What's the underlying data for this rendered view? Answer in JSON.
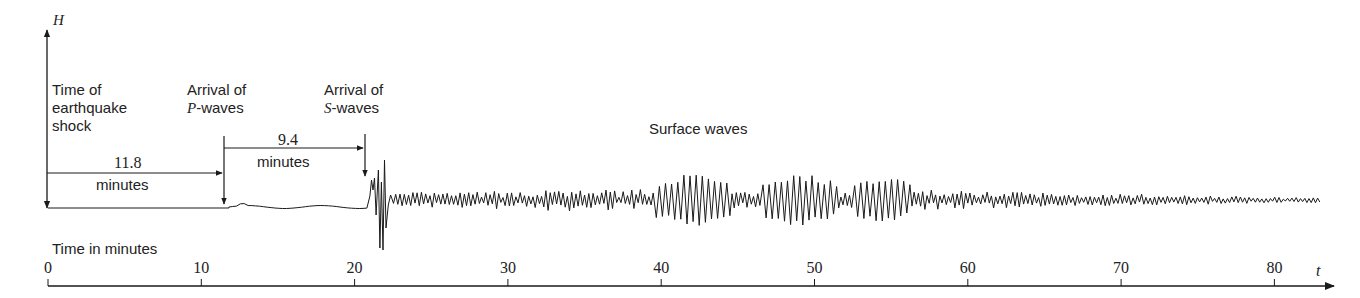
{
  "chart_data": {
    "type": "line",
    "title": "",
    "subtitle": "Seismogram showing arrival of P-waves, S-waves and surface waves",
    "ylabel": "H",
    "xlabel": "t",
    "x_axis_title": "Time in minutes",
    "x_ticks": [
      0,
      10,
      20,
      30,
      40,
      50,
      60,
      70,
      80
    ],
    "xlim": [
      0,
      83
    ],
    "grid": false,
    "legend": "none",
    "annotations": [
      {
        "text": "Time of earthquake shock",
        "x": 0
      },
      {
        "text": "Arrival of P-waves",
        "x": 11.8
      },
      {
        "text": "Arrival of S-waves",
        "x": 21.2
      },
      {
        "text": "Surface waves",
        "x": 40
      }
    ],
    "intervals": [
      {
        "from": 0,
        "to": 11.8,
        "value": "11.8",
        "unit": "minutes"
      },
      {
        "from": 11.8,
        "to": 21.2,
        "value": "9.4",
        "unit": "minutes"
      }
    ],
    "segments": [
      {
        "name": "quiet",
        "from": 0,
        "to": 11.8,
        "amplitude": 0
      },
      {
        "name": "P-waves",
        "from": 11.8,
        "to": 21.0,
        "amplitude": 1
      },
      {
        "name": "S-waves onset",
        "from": 21.0,
        "to": 22.0,
        "amplitude": 24
      },
      {
        "name": "body waves",
        "from": 22.0,
        "to": 39.5,
        "amplitude": 8
      },
      {
        "name": "surface waves burst 1",
        "from": 39.5,
        "to": 44.5,
        "amplitude": 20
      },
      {
        "name": "surface waves burst 2",
        "from": 46.5,
        "to": 51.5,
        "amplitude": 20
      },
      {
        "name": "surface waves burst 3",
        "from": 52.5,
        "to": 56.3,
        "amplitude": 18
      },
      {
        "name": "coda",
        "from": 56.3,
        "to": 83,
        "amplitude": 4
      }
    ]
  },
  "labels": {
    "y_axis": "H",
    "t_axis": "t",
    "time_in_minutes": "Time in minutes",
    "shock_line1": "Time of",
    "shock_line2": "earthquake",
    "shock_line3": "shock",
    "p_line1": "Arrival of",
    "p_line2_italic": "P",
    "p_line2_rest": "-waves",
    "s_line1": "Arrival of",
    "s_line2_italic": "S",
    "s_line2_rest": "-waves",
    "interval1_value": "11.8",
    "interval1_unit": "minutes",
    "interval2_value": "9.4",
    "interval2_unit": "minutes",
    "surface_waves": "Surface waves"
  },
  "ticks": [
    "0",
    "10",
    "20",
    "30",
    "40",
    "50",
    "60",
    "70",
    "80"
  ],
  "colors": {
    "ink": "#1a1a1a",
    "background": "#ffffff"
  }
}
